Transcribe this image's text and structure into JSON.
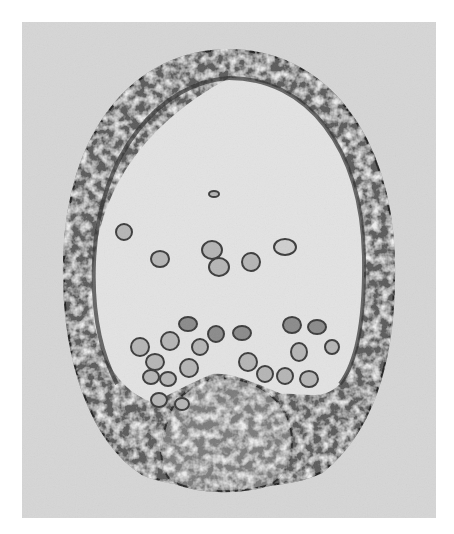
{
  "image": {
    "kind": "grayscale micrograph",
    "subject": "oval embryo with cellular wall, interior cells and basal invagination",
    "colors": {
      "margin": "#ffffff",
      "background": "#d6d6d6",
      "wall_dark": "#3a3a3a",
      "wall_mid": "#6e6e6e",
      "interior": "#e4e4e4",
      "cell_fill": "#b8b8b8",
      "cell_edge": "#3c3c3c"
    }
  }
}
